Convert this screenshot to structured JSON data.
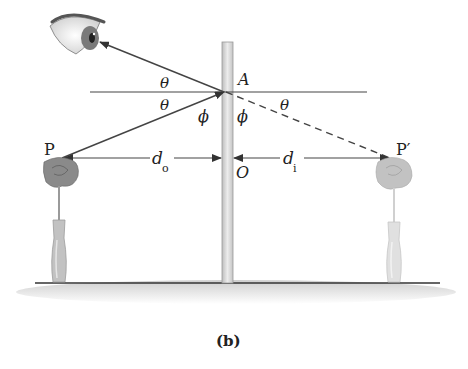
{
  "figure": {
    "caption": "(b)",
    "labels": {
      "point_A": "A",
      "point_O": "O",
      "object": "P",
      "image": "P′",
      "theta_upper": "θ",
      "theta_lower": "θ",
      "theta_right": "θ",
      "phi_left": "ϕ",
      "phi_right": "ϕ",
      "d_object": "d",
      "d_object_sub": "o",
      "d_image": "d",
      "d_image_sub": "i"
    },
    "colors": {
      "line": "#444444",
      "mirror_fill": "#d9d9d9",
      "rose_object": "#8a8a8a",
      "rose_image": "#c2c2c2",
      "vase_object": "#b5b5b5",
      "vase_image": "#dcdcdc",
      "floor_shadow": "#d6d6d6"
    }
  }
}
